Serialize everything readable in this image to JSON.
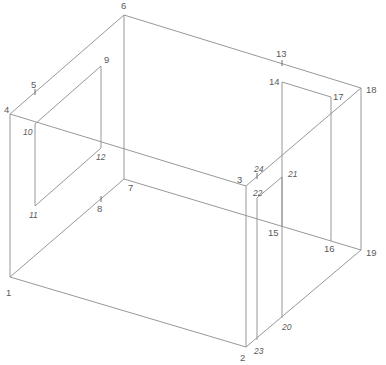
{
  "diagram": {
    "type": "isometric-wireframe-room",
    "stroke_color": "#8c8c8c",
    "label_color": "#5a5a5a",
    "vertices": {
      "1": {
        "x": 10,
        "y": 277,
        "label": "1",
        "lx": 6,
        "ly": 296,
        "italic": false
      },
      "2": {
        "x": 246,
        "y": 347,
        "label": "2",
        "lx": 240,
        "ly": 361,
        "italic": false
      },
      "3": {
        "x": 246,
        "y": 186,
        "label": "3",
        "lx": 237,
        "ly": 183,
        "italic": false
      },
      "4": {
        "x": 10,
        "y": 114,
        "label": "4",
        "lx": 4,
        "ly": 113,
        "italic": false
      },
      "5": {
        "x": 35,
        "y": 92,
        "label": "5",
        "lx": 31,
        "ly": 88,
        "italic": false
      },
      "6": {
        "x": 124,
        "y": 15,
        "label": "6",
        "lx": 121,
        "ly": 9,
        "italic": false
      },
      "7": {
        "x": 124,
        "y": 179,
        "label": "7",
        "lx": 128,
        "ly": 191,
        "italic": false
      },
      "8": {
        "x": 101,
        "y": 199,
        "label": "8",
        "lx": 97,
        "ly": 212,
        "italic": false
      },
      "9": {
        "x": 101,
        "y": 66,
        "label": "9",
        "lx": 104,
        "ly": 63,
        "italic": false
      },
      "10": {
        "x": 35,
        "y": 124,
        "label": "10",
        "lx": 23,
        "ly": 135,
        "italic": true
      },
      "11": {
        "x": 35,
        "y": 206,
        "label": "11",
        "lx": 29,
        "ly": 218,
        "italic": true
      },
      "12": {
        "x": 101,
        "y": 148,
        "label": "12",
        "lx": 96,
        "ly": 160,
        "italic": true
      },
      "13": {
        "x": 282,
        "y": 63,
        "label": "13",
        "lx": 276,
        "ly": 57,
        "italic": false
      },
      "14": {
        "x": 282,
        "y": 82,
        "label": "14",
        "lx": 269,
        "ly": 85,
        "italic": false
      },
      "15": {
        "x": 282,
        "y": 226,
        "label": "15",
        "lx": 268,
        "ly": 236,
        "italic": false
      },
      "16": {
        "x": 331,
        "y": 241,
        "label": "16",
        "lx": 324,
        "ly": 252,
        "italic": false
      },
      "17": {
        "x": 331,
        "y": 97,
        "label": "17",
        "lx": 333,
        "ly": 100,
        "italic": false
      },
      "18": {
        "x": 361,
        "y": 88,
        "label": "18",
        "lx": 366,
        "ly": 93,
        "italic": false
      },
      "19": {
        "x": 361,
        "y": 250,
        "label": "19",
        "lx": 366,
        "ly": 256,
        "italic": false
      },
      "20": {
        "x": 282,
        "y": 318,
        "label": "20",
        "lx": 282,
        "ly": 330,
        "italic": true
      },
      "21": {
        "x": 282,
        "y": 177,
        "label": "21",
        "lx": 288,
        "ly": 177,
        "italic": true
      },
      "22": {
        "x": 257,
        "y": 198,
        "label": "22",
        "lx": 253,
        "ly": 196,
        "italic": true
      },
      "23": {
        "x": 257,
        "y": 340,
        "label": "23",
        "lx": 254,
        "ly": 354,
        "italic": true
      },
      "24": {
        "x": 257,
        "y": 176,
        "label": "24",
        "lx": 254,
        "ly": 172,
        "italic": true
      }
    },
    "edges": [
      [
        "1",
        "2"
      ],
      [
        "1",
        "4"
      ],
      [
        "1",
        "7"
      ],
      [
        "2",
        "3"
      ],
      [
        "2",
        "19"
      ],
      [
        "3",
        "4"
      ],
      [
        "3",
        "18"
      ],
      [
        "4",
        "6"
      ],
      [
        "6",
        "7"
      ],
      [
        "6",
        "18"
      ],
      [
        "7",
        "19"
      ],
      [
        "18",
        "19"
      ],
      [
        "9",
        "10"
      ],
      [
        "10",
        "11"
      ],
      [
        "11",
        "12"
      ],
      [
        "9",
        "12"
      ],
      [
        "14",
        "17"
      ],
      [
        "14",
        "15"
      ],
      [
        "17",
        "16"
      ],
      [
        "22",
        "21"
      ],
      [
        "22",
        "23"
      ],
      [
        "21",
        "20"
      ]
    ],
    "ticks": [
      "5",
      "8",
      "13",
      "24"
    ]
  }
}
